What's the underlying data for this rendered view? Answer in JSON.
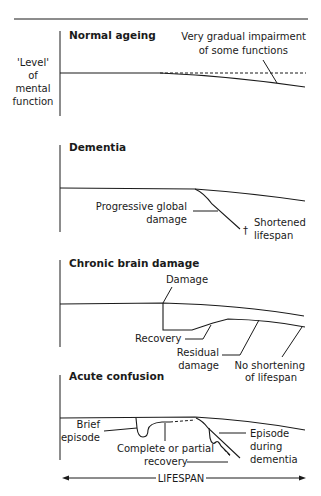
{
  "y_axis_label": [
    "'Level'",
    "of",
    "mental",
    "function"
  ],
  "x_axis_label": "LIFESPAN",
  "panels": [
    {
      "title": "Normal ageing",
      "annotations": [
        "Very gradual impairment",
        "of some functions"
      ]
    },
    {
      "title": "Dementia",
      "annotations": {
        "damage": [
          "Progressive global",
          "damage"
        ],
        "lifespan": [
          "Shortened",
          "lifespan"
        ],
        "dagger": "†"
      }
    },
    {
      "title": "Chronic brain damage",
      "annotations": {
        "damage": "Damage",
        "recovery": "Recovery",
        "residual": [
          "Residual",
          "damage"
        ],
        "no_shortening": [
          "No shortening",
          "of lifespan"
        ]
      }
    },
    {
      "title": "Acute confusion",
      "annotations": {
        "brief": [
          "Brief",
          "episode"
        ],
        "recovery": [
          "Complete or partial",
          "recovery"
        ],
        "episode_dementia": [
          "Episode",
          "during",
          "dementia"
        ]
      }
    }
  ],
  "colors": {
    "ink": "#1a1a1a",
    "background": "#ffffff"
  }
}
